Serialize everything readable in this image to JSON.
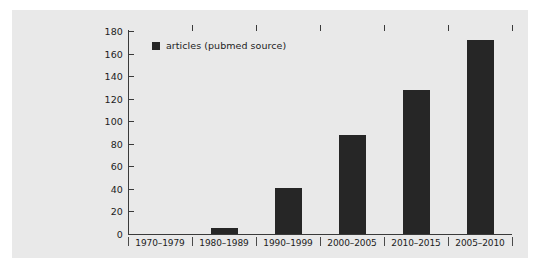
{
  "panel": {
    "background_color": "#e9e9e9",
    "page_background_color": "#ffffff"
  },
  "legend": {
    "position": "top-left-inside-plot",
    "swatch_color": "#262626",
    "label": "articles (pubmed source)"
  },
  "axis": {
    "line_color": "#3a3a3a",
    "y_labels": [
      "180",
      "160",
      "140",
      "120",
      "100",
      "80",
      "60",
      "40",
      "20",
      "0"
    ],
    "y_values": [
      180,
      160,
      140,
      120,
      100,
      80,
      60,
      40,
      20,
      0
    ]
  },
  "chart_data": {
    "type": "bar",
    "title": "",
    "subtitle": "",
    "xlabel": "",
    "ylabel": "",
    "categories": [
      "1970–1979",
      "1980–1989",
      "1990–1999",
      "2000–2005",
      "2010–2015",
      "2005–2010"
    ],
    "series": [
      {
        "name": "articles (pubmed source)",
        "color": "#262626",
        "values": [
          0,
          5,
          41,
          88,
          128,
          172
        ]
      }
    ],
    "values": [
      0,
      5,
      41,
      88,
      128,
      172
    ],
    "ylim": [
      0,
      180
    ],
    "ytick_step": 20,
    "yticks": [
      0,
      20,
      40,
      60,
      80,
      100,
      120,
      140,
      160,
      180
    ],
    "grid": false,
    "legend": "top-left",
    "bar_color": "#262626"
  }
}
